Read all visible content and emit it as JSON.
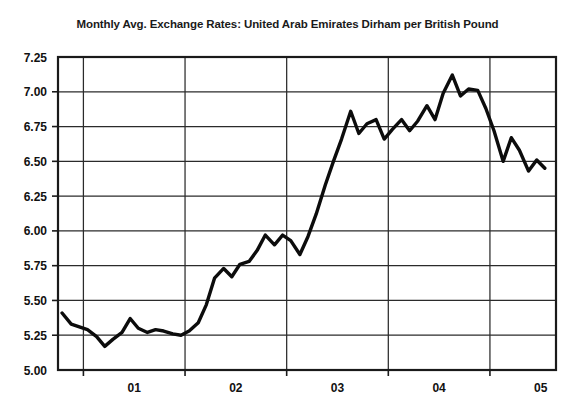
{
  "chart_data": {
    "type": "line",
    "title": "Monthly Avg. Exchange Rates: United Arab Emirates Dirham per British Pound",
    "xlabel": "",
    "ylabel": "",
    "grid": true,
    "legend": "none",
    "ylim": [
      5.0,
      7.25
    ],
    "ytick_labels": [
      "7.25",
      "7.00",
      "6.75",
      "6.50",
      "6.25",
      "6.00",
      "5.75",
      "5.50",
      "5.25",
      "5.00"
    ],
    "ytick_values": [
      7.25,
      7.0,
      6.75,
      6.5,
      6.25,
      6.0,
      5.75,
      5.5,
      5.25,
      5.0
    ],
    "xtick_labels": [
      "01",
      "02",
      "03",
      "04",
      "05"
    ],
    "xlim": [
      2000.75,
      2005.65
    ],
    "x_gridline_values": [
      2001.0,
      2002.0,
      2003.0,
      2004.0,
      2005.0
    ],
    "x": [
      2000.79,
      2000.88,
      2000.96,
      2001.04,
      2001.13,
      2001.21,
      2001.29,
      2001.38,
      2001.46,
      2001.54,
      2001.63,
      2001.71,
      2001.79,
      2001.88,
      2001.96,
      2002.04,
      2002.13,
      2002.21,
      2002.29,
      2002.38,
      2002.46,
      2002.54,
      2002.63,
      2002.71,
      2002.79,
      2002.88,
      2002.96,
      2003.04,
      2003.13,
      2003.21,
      2003.29,
      2003.38,
      2003.46,
      2003.54,
      2003.63,
      2003.71,
      2003.79,
      2003.88,
      2003.96,
      2004.04,
      2004.13,
      2004.21,
      2004.29,
      2004.38,
      2004.46,
      2004.54,
      2004.63,
      2004.71,
      2004.79,
      2004.88,
      2004.96,
      2005.04,
      2005.13,
      2005.21,
      2005.29,
      2005.38,
      2005.46,
      2005.54
    ],
    "values": [
      5.41,
      5.33,
      5.31,
      5.29,
      5.24,
      5.17,
      5.22,
      5.27,
      5.37,
      5.3,
      5.27,
      5.29,
      5.28,
      5.26,
      5.25,
      5.28,
      5.34,
      5.47,
      5.66,
      5.73,
      5.67,
      5.76,
      5.78,
      5.86,
      5.97,
      5.9,
      5.97,
      5.93,
      5.83,
      5.96,
      6.12,
      6.33,
      6.5,
      6.66,
      6.86,
      6.7,
      6.77,
      6.8,
      6.66,
      6.73,
      6.8,
      6.72,
      6.79,
      6.9,
      6.8,
      6.99,
      7.12,
      6.97,
      7.02,
      7.01,
      6.88,
      6.72,
      6.5,
      6.67,
      6.58,
      6.43,
      6.51,
      6.45
    ],
    "series_name": "AED per GBP"
  },
  "axis": {
    "ytick_0": "7.25",
    "ytick_1": "7.00",
    "ytick_2": "6.75",
    "ytick_3": "6.50",
    "ytick_4": "6.25",
    "ytick_5": "6.00",
    "ytick_6": "5.75",
    "ytick_7": "5.50",
    "ytick_8": "5.25",
    "ytick_9": "5.00",
    "xtick_0": "01",
    "xtick_1": "02",
    "xtick_2": "03",
    "xtick_3": "04",
    "xtick_4": "05"
  },
  "colors": {
    "line": "#0c0c0c",
    "grid": "#2b2b2b",
    "axis": "#1a1a1a",
    "background": "#ffffff",
    "text": "#111111"
  }
}
